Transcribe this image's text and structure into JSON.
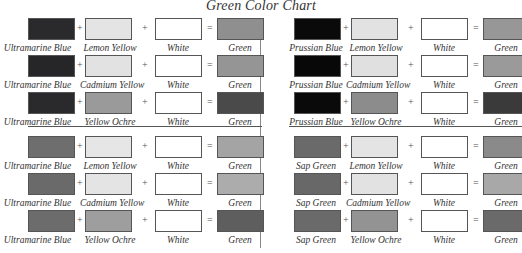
{
  "title": "Green Color Chart",
  "operators": {
    "plus": "+",
    "equals": "="
  },
  "panels": [
    {
      "rows": [
        {
          "a": {
            "name": "Ultramarine Blue",
            "color": "#2a2a2c"
          },
          "b": {
            "name": "Lemon Yellow",
            "color": "#e4e4e4"
          },
          "c": {
            "name": "White",
            "color": "#ffffff"
          },
          "r": {
            "name": "Green",
            "color": "#8f8f8f"
          }
        },
        {
          "a": {
            "name": "Ultramarine Blue",
            "color": "#262628"
          },
          "b": {
            "name": "Cadmium Yellow",
            "color": "#e2e2e2"
          },
          "c": {
            "name": "White",
            "color": "#ffffff"
          },
          "r": {
            "name": "Green",
            "color": "#959595"
          }
        },
        {
          "a": {
            "name": "Ultramarine Blue",
            "color": "#2a2a2c"
          },
          "b": {
            "name": "Yellow Ochre",
            "color": "#9a9a9a"
          },
          "c": {
            "name": "White",
            "color": "#ffffff"
          },
          "r": {
            "name": "Green",
            "color": "#4a4a4a"
          }
        },
        {
          "a": {
            "name": "Ultramarine Blue",
            "color": "#6e6e6e"
          },
          "b": {
            "name": "Lemon Yellow",
            "color": "#e6e6e6"
          },
          "c": {
            "name": "White",
            "color": "#ffffff"
          },
          "r": {
            "name": "Green",
            "color": "#a4a4a4"
          }
        },
        {
          "a": {
            "name": "Ultramarine Blue",
            "color": "#6a6a6a"
          },
          "b": {
            "name": "Cadmium Yellow",
            "color": "#e4e4e4"
          },
          "c": {
            "name": "White",
            "color": "#ffffff"
          },
          "r": {
            "name": "Green",
            "color": "#acacac"
          }
        },
        {
          "a": {
            "name": "Ultramarine Blue",
            "color": "#6c6c6c"
          },
          "b": {
            "name": "Yellow Ochre",
            "color": "#9e9e9e"
          },
          "c": {
            "name": "White",
            "color": "#ffffff"
          },
          "r": {
            "name": "Green",
            "color": "#5e5e5e"
          }
        }
      ]
    },
    {
      "rows": [
        {
          "a": {
            "name": "Prussian Blue",
            "color": "#0a0a0a"
          },
          "b": {
            "name": "Lemon Yellow",
            "color": "#e2e2e2"
          },
          "c": {
            "name": "White",
            "color": "#ffffff"
          },
          "r": {
            "name": "Green",
            "color": "#979797"
          }
        },
        {
          "a": {
            "name": "Prussian Blue",
            "color": "#080808"
          },
          "b": {
            "name": "Cadmium Yellow",
            "color": "#e0e0e0"
          },
          "c": {
            "name": "White",
            "color": "#ffffff"
          },
          "r": {
            "name": "Green",
            "color": "#9a9a9a"
          }
        },
        {
          "a": {
            "name": "Prussian Blue",
            "color": "#0a0a0a"
          },
          "b": {
            "name": "Yellow Ochre",
            "color": "#8c8c8c"
          },
          "c": {
            "name": "White",
            "color": "#ffffff"
          },
          "r": {
            "name": "Green",
            "color": "#3a3a3a"
          }
        },
        {
          "a": {
            "name": "Sap Green",
            "color": "#6a6a6a"
          },
          "b": {
            "name": "Lemon Yellow",
            "color": "#e4e4e4"
          },
          "c": {
            "name": "White",
            "color": "#ffffff"
          },
          "r": {
            "name": "Green",
            "color": "#8a8a8a"
          }
        },
        {
          "a": {
            "name": "Sap Green",
            "color": "#686868"
          },
          "b": {
            "name": "Cadmium Yellow",
            "color": "#e2e2e2"
          },
          "c": {
            "name": "White",
            "color": "#ffffff"
          },
          "r": {
            "name": "Green",
            "color": "#a8a8a8"
          }
        },
        {
          "a": {
            "name": "Sap Green",
            "color": "#6a6a6a"
          },
          "b": {
            "name": "Yellow Ochre",
            "color": "#939393"
          },
          "c": {
            "name": "White",
            "color": "#ffffff"
          },
          "r": {
            "name": "Green",
            "color": "#6a6a6a"
          }
        }
      ]
    }
  ]
}
